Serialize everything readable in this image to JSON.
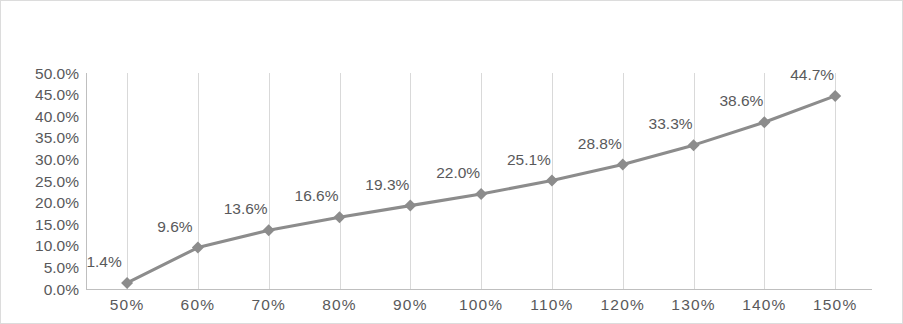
{
  "chart_data": {
    "type": "line",
    "title": "",
    "subtitle": "",
    "xlabel": "",
    "ylabel": "",
    "categories": [
      "50%",
      "60%",
      "70%",
      "80%",
      "90%",
      "100%",
      "110%",
      "120%",
      "130%",
      "140%",
      "150%"
    ],
    "values": [
      1.4,
      9.6,
      13.6,
      16.6,
      19.3,
      22.0,
      25.1,
      28.8,
      33.3,
      38.6,
      44.7
    ],
    "point_labels": [
      "1.4%",
      "9.6%",
      "13.6%",
      "16.6%",
      "19.3%",
      "22.0%",
      "25.1%",
      "28.8%",
      "33.3%",
      "38.6%",
      "44.7%"
    ],
    "series": [
      {
        "name": "",
        "values": [
          1.4,
          9.6,
          13.6,
          16.6,
          19.3,
          22.0,
          25.1,
          28.8,
          33.3,
          38.6,
          44.7
        ],
        "color": "#8c8c8c",
        "marker": "diamond"
      }
    ],
    "ylim": [
      0,
      50
    ],
    "ytick_step": 5,
    "ytick_labels": [
      "50.0%",
      "45.0%",
      "40.0%",
      "35.0%",
      "30.0%",
      "25.0%",
      "20.0%",
      "15.0%",
      "10.0%",
      "5.0%",
      "0.0%"
    ],
    "ytick_values": [
      50,
      45,
      40,
      35,
      30,
      25,
      20,
      15,
      10,
      5,
      0
    ],
    "grid": "vertical",
    "legend": "none",
    "legend_position": "",
    "value_format": "percent-one-decimal",
    "plot_background": "#ffffff",
    "border_color": "#dcdcdc",
    "axis_color": "#bfbfbf",
    "gridline_color": "#d9d9d9",
    "label_color": "#59595b"
  }
}
